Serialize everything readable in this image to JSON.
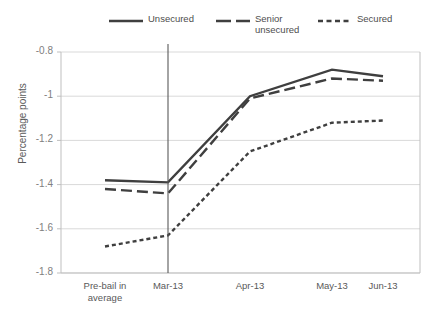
{
  "chart_data": {
    "type": "line",
    "title": "",
    "xlabel": "",
    "ylabel": "Percentage points",
    "categories": [
      "Pre-bail in average",
      "Mar-13",
      "Apr-13",
      "May-13",
      "Jun-13"
    ],
    "ylim": [
      -1.8,
      -0.8
    ],
    "ytick_labels": [
      "-0.8",
      "-1",
      "-1.2",
      "-1.4",
      "-1.6",
      "-1.8"
    ],
    "ytick_values": [
      -0.8,
      -1.0,
      -1.2,
      -1.4,
      -1.6,
      -1.8
    ],
    "grid": "horizontal",
    "legend_position": "top",
    "annotations": [
      {
        "name": "event-divider",
        "at_category": "Mar-13",
        "style": "vertical-line"
      }
    ],
    "series": [
      {
        "name": "Unsecured",
        "style": "solid",
        "color": "#3f3f3f",
        "values": [
          -1.38,
          -1.39,
          -1.0,
          -0.88,
          -0.91
        ]
      },
      {
        "name": "Senior unsecured",
        "style": "dashed",
        "color": "#3f3f3f",
        "values": [
          -1.42,
          -1.44,
          -1.01,
          -0.92,
          -0.93
        ]
      },
      {
        "name": "Secured",
        "style": "dotted",
        "color": "#3f3f3f",
        "values": [
          -1.68,
          -1.63,
          -1.25,
          -1.12,
          -1.11
        ]
      }
    ]
  },
  "axis": {
    "y_title": "Percentage points",
    "y_labels": [
      "-0.8",
      "-1",
      "-1.2",
      "-1.4",
      "-1.6",
      "-1.8"
    ],
    "x_labels": [
      "Pre-bail in average",
      "Mar-13",
      "Apr-13",
      "May-13",
      "Jun-13"
    ]
  },
  "legend": {
    "items": [
      {
        "label": "Unsecured",
        "swatch": "solid-line-icon"
      },
      {
        "label": "Senior unsecured",
        "swatch": "dashed-line-icon"
      },
      {
        "label": "Secured",
        "swatch": "dotted-line-icon"
      }
    ]
  },
  "colors": {
    "line": "#3f3f3f",
    "grid": "#d9d9d9",
    "axis": "#bfbfbf",
    "divider": "#595959",
    "text": "#595959"
  }
}
